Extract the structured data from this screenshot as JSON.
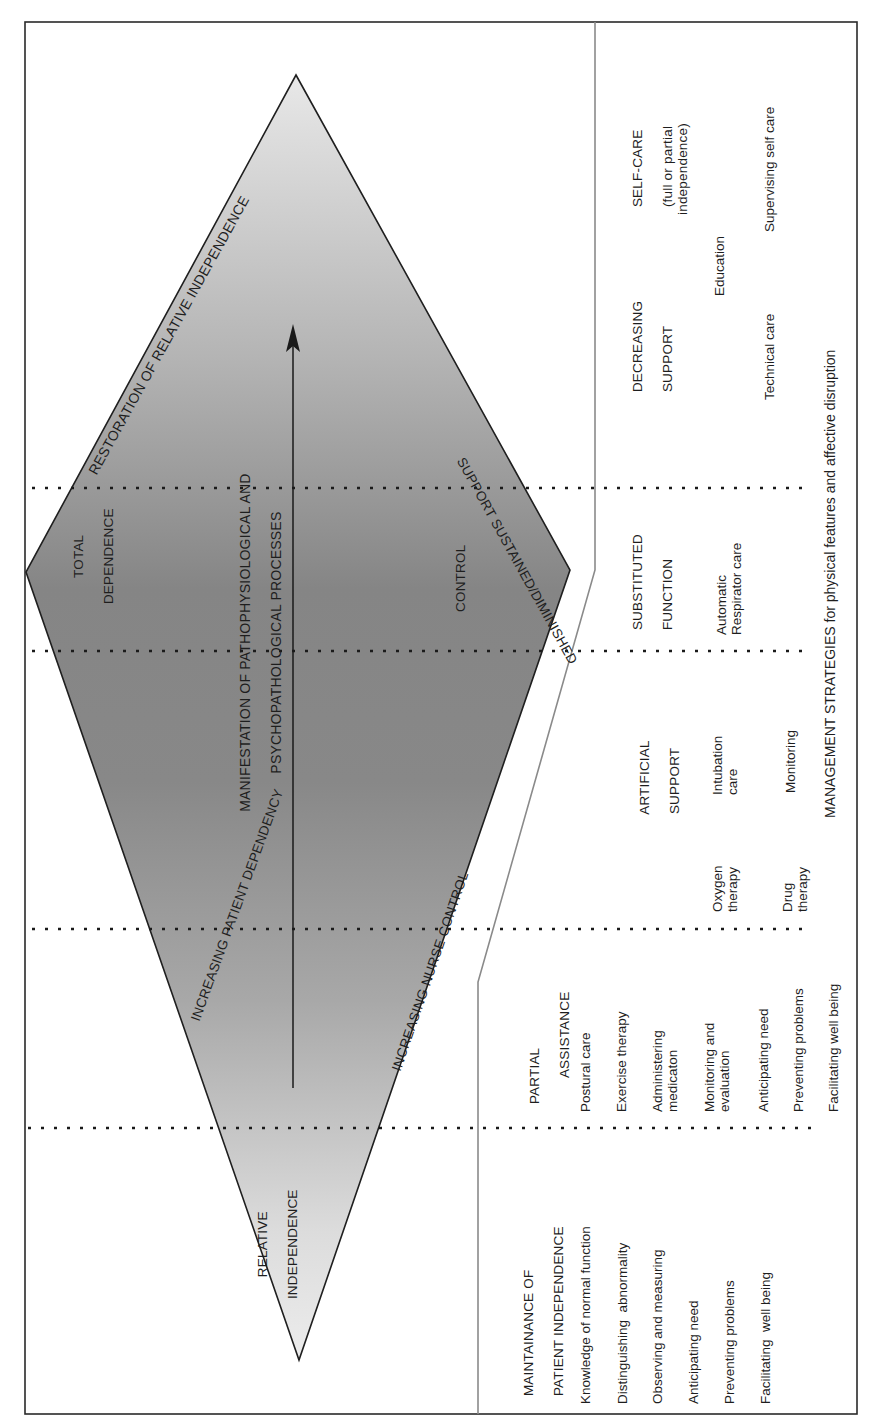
{
  "orientation": "rotated-90-ccw",
  "colors": {
    "frame": "#2a2a2a",
    "divider": "#8a8a8a",
    "shape_dark": "#7f7f7f",
    "shape_light": "#e6e6e6",
    "dots": "#1a1a1a"
  },
  "diamond": {
    "top_label": "RESTORATION OF RELATIVE INDEPENDENCE",
    "top_right_label": "SUPPORT SUSTAINED/DIMINISHED",
    "center_label_line1": "MANIFESTATION OF PATHOPHYSIOLOGICAL AND",
    "center_label_line2": "PSYCHOPATHOLOGICAL PROCESSES",
    "left_vertex_label_line1": "TOTAL",
    "left_vertex_label_line2": "DEPENDENCE",
    "right_vertex_label": "CONTROL",
    "lower_left_label": "INCREASING PATIENT DEPENDENCY",
    "lower_right_label": "INCREASING NURSE CONTROL",
    "bottom_label_line1": "RELATIVE",
    "bottom_label_line2": "INDEPENDENCE",
    "arrow": "arrow-up"
  },
  "management_strategies": {
    "title": "MANAGEMENT STRATEGIES for physical features and affective disruption"
  },
  "stages": [
    {
      "heading_line1": "MAINTAINANCE OF",
      "heading_line2": "PATIENT INDEPENDENCE",
      "items": [
        "Knowledge of normal function",
        "Distinguishing  abnormality",
        "Observing and measuring",
        "Anticipating need",
        "Preventing problems",
        "Facilitating  well being"
      ]
    },
    {
      "heading_line1": "PARTIAL",
      "heading_line2": "ASSISTANCE",
      "items": [
        "Postural care",
        "Exercise therapy",
        "Administering\nmedicaton",
        "Monitoring and\nevaluation",
        "Anticipating need",
        "Preventing problems",
        "Facilitating well being"
      ]
    },
    {
      "heading_line1": "ARTIFICIAL",
      "heading_line2": "SUPPORT",
      "items": [
        "Oxygen\ntherapy",
        "Drug\ntherapy",
        "Intubation\ncare",
        "Monitoring"
      ]
    },
    {
      "heading_line1": "SUBSTITUTED",
      "heading_line2": "FUNCTION",
      "items": [
        "Automatic\nRespirator care"
      ]
    },
    {
      "heading_line1": "DECREASING",
      "heading_line2": "SUPPORT",
      "items": [
        "Education",
        "Technical care"
      ]
    },
    {
      "heading_line1": "SELF-CARE",
      "heading_line2": "(full or partial\nindependence)",
      "items": [
        "Supervising self care"
      ]
    }
  ]
}
